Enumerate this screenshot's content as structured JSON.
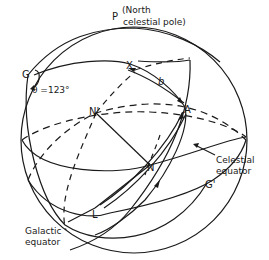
{
  "diagram": {
    "labels": {
      "pole_letter": "P",
      "pole_desc_line1": "(North",
      "pole_desc_line2": "celestial pole)",
      "G": "G",
      "theta": "θ =123°",
      "X": "X",
      "b": "b",
      "A": "A",
      "N_prime": "N'",
      "N": "N",
      "L": "L",
      "G_prime": "G'",
      "celestial_equator_line1": "Celestial",
      "celestial_equator_line2": "equator",
      "galactic_equator_line1": "Galactic",
      "galactic_equator_line2": "equator"
    },
    "colors": {
      "stroke": "#1a1a1a",
      "background": "#ffffff"
    }
  }
}
